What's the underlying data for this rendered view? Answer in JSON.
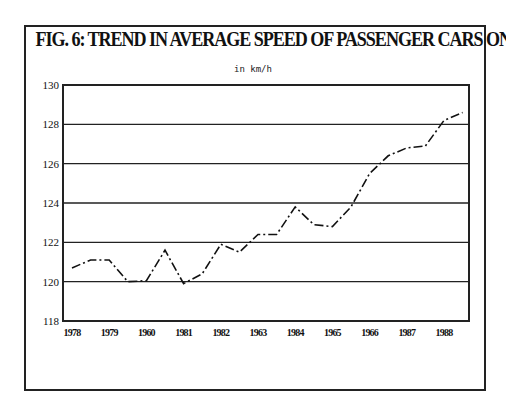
{
  "chart_data": {
    "type": "line",
    "title": "FIG. 6: TREND IN AVERAGE SPEED OF PASSENGER CARS ON HIGHWAYS",
    "subtitle": "in km/h",
    "xlabel": "",
    "ylabel": "",
    "ylim": [
      118,
      130
    ],
    "yticks": [
      118,
      120,
      122,
      124,
      126,
      128,
      130
    ],
    "xtick_labels": [
      "1978",
      "1979",
      "1960",
      "1981",
      "1982",
      "1963",
      "1984",
      "1965",
      "1966",
      "1987",
      "1988"
    ],
    "grid": "horizontal",
    "legend": "none",
    "line_style": "dash-dot",
    "series": [
      {
        "name": "Average speed (km/h)",
        "x": [
          1978.0,
          1978.5,
          1979.0,
          1979.5,
          1980.0,
          1980.5,
          1981.0,
          1981.5,
          1982.0,
          1982.5,
          1983.0,
          1983.5,
          1984.0,
          1984.5,
          1985.0,
          1985.5,
          1986.0,
          1986.5,
          1987.0,
          1987.5,
          1988.0,
          1988.5
        ],
        "values": [
          120.7,
          121.1,
          121.1,
          120.0,
          120.05,
          121.6,
          119.9,
          120.4,
          121.9,
          121.5,
          122.4,
          122.4,
          123.8,
          122.9,
          122.8,
          123.8,
          125.5,
          126.4,
          126.8,
          126.9,
          128.2,
          128.6
        ]
      }
    ]
  }
}
